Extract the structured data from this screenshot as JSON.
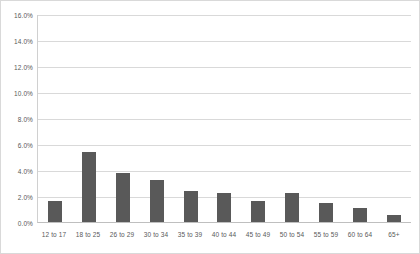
{
  "chart_data": {
    "type": "bar",
    "title": "",
    "subtitle": "",
    "xlabel": "",
    "ylabel": "",
    "legend": [],
    "grid": "horizontal",
    "ylim": [
      0,
      16
    ],
    "yticks": [
      "0.0%",
      "2.0%",
      "4.0%",
      "6.0%",
      "8.0%",
      "10.0%",
      "12.0%",
      "14.0%",
      "16.0%"
    ],
    "ytick_values": [
      0,
      2,
      4,
      6,
      8,
      10,
      12,
      14,
      16
    ],
    "categories": [
      "12 to 17",
      "18 to 25",
      "26 to 29",
      "30 to 34",
      "35 to 39",
      "40 to 44",
      "45 to 49",
      "50 to 54",
      "55 to 59",
      "60 to 64",
      "65+"
    ],
    "values": [
      1.6,
      5.4,
      3.8,
      3.2,
      2.35,
      2.25,
      1.65,
      2.2,
      1.45,
      1.05,
      0.55
    ],
    "value_labels": [
      "1.6%",
      "5.4%",
      "3.8%",
      "3.2%",
      "2.4%",
      "2.3%",
      "1.7%",
      "2.2%",
      "1.5%",
      "1.1%",
      "0.6%"
    ],
    "bar_color": "#595959",
    "gridline_color": "#d9d9d9",
    "axis_color": "#bfbfbf",
    "text_color": "#595959",
    "background_color": "#ffffff",
    "border_color": "#d9d9d9"
  }
}
